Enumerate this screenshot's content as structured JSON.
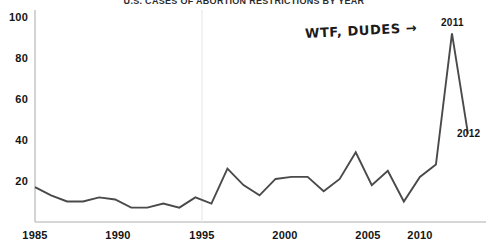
{
  "chart_data": {
    "type": "line",
    "title": "U.S. CASES OF ABORTION RESTRICTIONS BY YEAR",
    "xlabel": "",
    "ylabel": "",
    "xlim": [
      1985,
      2012
    ],
    "ylim": [
      0,
      100
    ],
    "grid": false,
    "legend": "none",
    "xticks": [
      "1985",
      "1990",
      "1995",
      "2000",
      "2005",
      "2010"
    ],
    "yticks": [
      "20",
      "40",
      "60",
      "80",
      "100"
    ],
    "x": [
      1985,
      1986,
      1987,
      1988,
      1989,
      1990,
      1991,
      1992,
      1993,
      1994,
      1995,
      1996,
      1997,
      1998,
      1999,
      2000,
      2001,
      2002,
      2003,
      2004,
      2005,
      2006,
      2007,
      2008,
      2009,
      2010,
      2011,
      2012
    ],
    "values": [
      17,
      13,
      10,
      10,
      12,
      11,
      7,
      7,
      9,
      7,
      12,
      9,
      26,
      18,
      13,
      21,
      22,
      22,
      15,
      21,
      34,
      18,
      25,
      10,
      22,
      28,
      92,
      43
    ],
    "series": [
      {
        "name": "Abortion restrictions enacted",
        "values": [
          17,
          13,
          10,
          10,
          12,
          11,
          7,
          7,
          9,
          7,
          12,
          9,
          26,
          18,
          13,
          21,
          22,
          22,
          15,
          21,
          34,
          18,
          25,
          10,
          22,
          28,
          92,
          43
        ],
        "color": "#4a4a4a"
      }
    ],
    "annotations": [
      {
        "id": "callout",
        "text": "WTF, DUDES →",
        "points_to": 2011
      },
      {
        "id": "peak-label",
        "text": "2011",
        "value": 92
      },
      {
        "id": "end-label",
        "text": "2012",
        "value": 43
      }
    ]
  },
  "axes": {
    "y_labels": [
      {
        "text": "100",
        "top": 11
      },
      {
        "text": "80",
        "top": 52
      },
      {
        "text": "60",
        "top": 93
      },
      {
        "text": "40",
        "top": 134
      },
      {
        "text": "20",
        "top": 175
      }
    ],
    "x_labels": [
      {
        "text": "1985",
        "left": 13
      },
      {
        "text": "1990",
        "left": 96
      },
      {
        "text": "1995",
        "left": 180
      },
      {
        "text": "2000",
        "left": 263
      },
      {
        "text": "2005",
        "left": 346
      },
      {
        "text": "2010",
        "left": 398
      }
    ]
  },
  "colors": {
    "line": "#4a4a4a",
    "axis": "#c9c9c9",
    "text": "#141414",
    "background": "#ffffff"
  }
}
